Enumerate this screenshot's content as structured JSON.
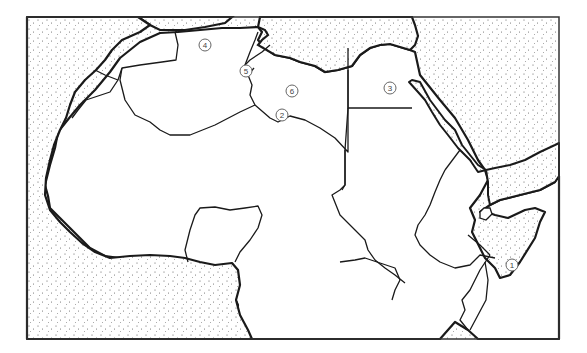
{
  "map": {
    "title": "North Africa and Horn of Africa outline map",
    "colors": {
      "land": "#ffffff",
      "sea_stipple": "#555555",
      "border": "#1a1a1a",
      "frame": "#333333"
    },
    "labels": [
      {
        "id": "1",
        "text": "1",
        "x": 512,
        "y": 265
      },
      {
        "id": "2",
        "text": "2",
        "x": 282,
        "y": 115
      },
      {
        "id": "3",
        "text": "3",
        "x": 390,
        "y": 88
      },
      {
        "id": "4",
        "text": "4",
        "x": 205,
        "y": 45
      },
      {
        "id": "5",
        "text": "5",
        "x": 246,
        "y": 71
      },
      {
        "id": "6",
        "text": "6",
        "x": 292,
        "y": 91
      }
    ]
  }
}
